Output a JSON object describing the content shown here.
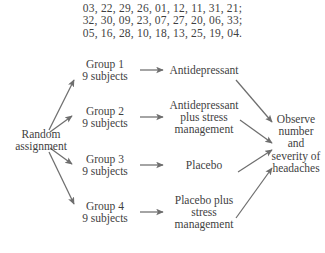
{
  "random_digits": {
    "lines": [
      "03, 22, 29, 26, 01, 12, 11, 31, 21;",
      "32, 30, 09, 23, 07, 27, 20, 06, 33;",
      "05, 16, 28, 10, 18, 13, 25, 19, 04."
    ]
  },
  "diagram": {
    "start": {
      "line1": "Random",
      "line2": "assignment"
    },
    "groups": [
      {
        "name": "Group 1",
        "size": "9 subjects"
      },
      {
        "name": "Group 2",
        "size": "9 subjects"
      },
      {
        "name": "Group 3",
        "size": "9 subjects"
      },
      {
        "name": "Group 4",
        "size": "9 subjects"
      }
    ],
    "treatments": [
      {
        "line1": "Antidepressant",
        "line2": "",
        "line3": ""
      },
      {
        "line1": "Antidepressant",
        "line2": "plus stress",
        "line3": "management"
      },
      {
        "line1": "Placebo",
        "line2": "",
        "line3": ""
      },
      {
        "line1": "Placebo plus",
        "line2": "stress",
        "line3": "management"
      }
    ],
    "outcome": {
      "line1": "Observe",
      "line2": "number",
      "line3": "and",
      "line4": "severity of",
      "line5": "headaches"
    }
  },
  "style": {
    "text_color": "#3f3f3f",
    "arrow_color": "#6e6e6e",
    "background": "#ffffff"
  }
}
